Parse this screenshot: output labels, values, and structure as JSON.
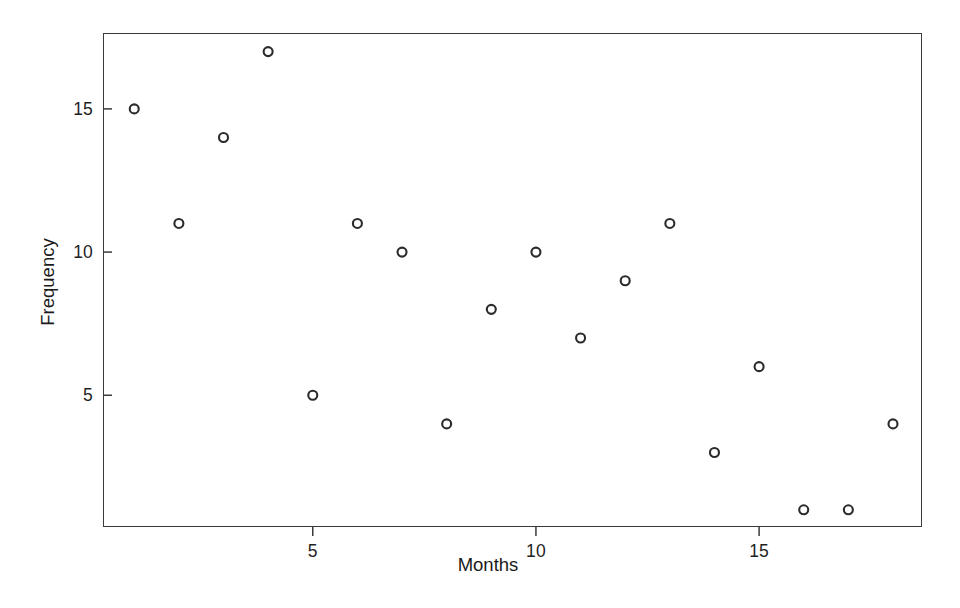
{
  "chart_data": {
    "type": "scatter",
    "title": "",
    "xlabel": "Months",
    "ylabel": "Frequency",
    "x": [
      1,
      2,
      3,
      4,
      5,
      6,
      7,
      8,
      9,
      10,
      11,
      12,
      13,
      14,
      15,
      16,
      17,
      18
    ],
    "y": [
      15,
      11,
      14,
      17,
      5,
      11,
      10,
      4,
      8,
      10,
      7,
      9,
      11,
      3,
      6,
      1,
      1,
      4
    ],
    "points": [
      {
        "x": 1,
        "y": 15
      },
      {
        "x": 2,
        "y": 11
      },
      {
        "x": 3,
        "y": 14
      },
      {
        "x": 4,
        "y": 17
      },
      {
        "x": 5,
        "y": 5
      },
      {
        "x": 6,
        "y": 11
      },
      {
        "x": 7,
        "y": 10
      },
      {
        "x": 8,
        "y": 4
      },
      {
        "x": 9,
        "y": 8
      },
      {
        "x": 10,
        "y": 10
      },
      {
        "x": 11,
        "y": 7
      },
      {
        "x": 12,
        "y": 9
      },
      {
        "x": 13,
        "y": 11
      },
      {
        "x": 14,
        "y": 3
      },
      {
        "x": 15,
        "y": 6
      },
      {
        "x": 16,
        "y": 1
      },
      {
        "x": 17,
        "y": 1
      },
      {
        "x": 18,
        "y": 4
      }
    ],
    "xlim": [
      0.3,
      18.65
    ],
    "ylim": [
      0.4,
      17.65
    ],
    "xticks": [
      5,
      10,
      15
    ],
    "xtick_labels": [
      "5",
      "10",
      "15"
    ],
    "yticks": [
      5,
      10,
      15
    ],
    "ytick_labels": [
      "5",
      "10",
      "15"
    ],
    "grid": false,
    "legend": null,
    "marker": {
      "shape": "open-circle",
      "diameter_px": 9,
      "stroke_width_px": 2.1,
      "stroke_color": "#2b2b2b",
      "fill": "none"
    },
    "frame": {
      "color": "#3a3a3a",
      "width_px": 1.6,
      "visible_sides": [
        "top",
        "right",
        "bottom",
        "left"
      ]
    },
    "tick_direction": {
      "y": "in",
      "x": "out"
    },
    "background_color": "#ffffff",
    "annotations": []
  },
  "axes": {
    "x_title": "Months",
    "y_title": "Frequency"
  }
}
